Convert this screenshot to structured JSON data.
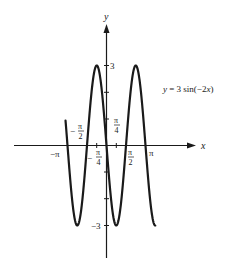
{
  "chart_data": {
    "type": "line",
    "title": "",
    "equation_label": "y = 3 sin(−2x)",
    "xlabel": "x",
    "ylabel": "y",
    "function": "3*sin(-2*x)",
    "x_domain": [
      -3.3,
      3.93
    ],
    "ylim": [
      -3,
      3
    ],
    "x_ticks": [
      {
        "value": -3.14159,
        "label": "−π"
      },
      {
        "value": -1.5708,
        "label": "−π/2"
      },
      {
        "value": -0.7854,
        "label": "−π/4"
      },
      {
        "value": 0.7854,
        "label": "π/4"
      },
      {
        "value": 1.5708,
        "label": "π/2"
      },
      {
        "value": 3.14159,
        "label": "π"
      }
    ],
    "y_ticks": [
      {
        "value": 3,
        "label": "3"
      },
      {
        "value": -3,
        "label": "−3"
      }
    ],
    "minor_y_ticks": [
      -2,
      -1,
      1,
      2
    ],
    "grid": false,
    "legend": null,
    "series": [
      {
        "name": "y = 3 sin(−2x)",
        "x": [
          -3.3,
          -3.14159,
          -2.356,
          -1.5708,
          -0.7854,
          0,
          0.7854,
          1.5708,
          2.356,
          3.14159,
          3.927
        ],
        "values": [
          0.94,
          0,
          -3,
          0,
          3,
          0,
          -3,
          0,
          3,
          0,
          -3
        ]
      }
    ]
  },
  "labels": {
    "y_axis": "y",
    "x_axis": "x",
    "equation_lhs": "y",
    "equation_rhs": " =  3 sin(−2",
    "equation_var": "x",
    "equation_close": ")",
    "tick_pos3": "3",
    "tick_neg3": "−3",
    "neg_pi": "−π",
    "pi": "π",
    "pi_sym": "π",
    "minus": "−",
    "two": "2",
    "four": "4"
  }
}
